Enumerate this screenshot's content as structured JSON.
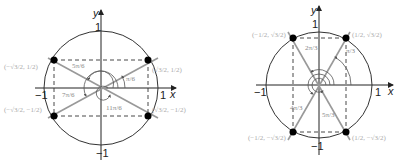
{
  "diagrams": [
    {
      "id": "left",
      "axis_labels": {
        "x": "x",
        "y": "y"
      },
      "ticks": {
        "pos_x": "1",
        "neg_x": "−1",
        "pos_y": "1",
        "neg_y": "−1"
      },
      "points": [
        {
          "label": "(√3/2, 1/2)"
        },
        {
          "label": "(−√3/2, 1/2)"
        },
        {
          "label": "(−√3/2, −1/2)"
        },
        {
          "label": "(√3/2, −1/2)"
        }
      ],
      "angles": [
        {
          "label": "π/6"
        },
        {
          "label": "5π/6"
        },
        {
          "label": "7π/6"
        },
        {
          "label": "11π/6"
        }
      ]
    },
    {
      "id": "right",
      "axis_labels": {
        "x": "x",
        "y": "y"
      },
      "ticks": {
        "pos_x": "1",
        "neg_x": "−1",
        "pos_y": "1",
        "neg_y": "−1"
      },
      "points": [
        {
          "label": "(1/2, √3/2)"
        },
        {
          "label": "(−1/2, √3/2)"
        },
        {
          "label": "(−1/2, −√3/2)"
        },
        {
          "label": "(1/2, −√3/2)"
        }
      ],
      "angles": [
        {
          "label": "π/3"
        },
        {
          "label": "2π/3"
        },
        {
          "label": "4π/3"
        },
        {
          "label": "5π/3"
        }
      ]
    }
  ]
}
